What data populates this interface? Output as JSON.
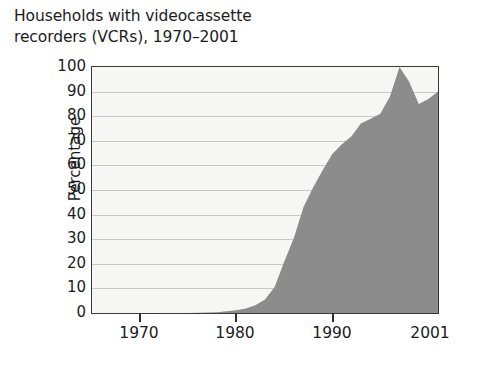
{
  "chart_data": {
    "type": "area",
    "title": "Households with videocassette recorders (VCRs), 1970–2001",
    "title_line1": "Households with videocassette",
    "title_line2": "recorders (VCRs), 1970–2001",
    "xlabel": "",
    "ylabel": "Percentage",
    "xlim": [
      1965,
      2001
    ],
    "ylim": [
      0,
      100
    ],
    "grid": true,
    "legend": false,
    "fill_color": "#8c8c8c",
    "plot_background": "#f6f6f4",
    "gridline_color": "#c9c9c6",
    "axis_color": "#3a3a3a",
    "ytick_labels": [
      "100",
      "90",
      "80",
      "70",
      "60",
      "50",
      "40",
      "30",
      "20",
      "10",
      "0"
    ],
    "ytick_values": [
      100,
      90,
      80,
      70,
      60,
      50,
      40,
      30,
      20,
      10,
      0
    ],
    "xtick_labels": [
      "1970",
      "1980",
      "1990",
      "2001"
    ],
    "xtick_values": [
      1970,
      1980,
      1990,
      2001
    ],
    "x": [
      1965,
      1970,
      1975,
      1978,
      1980,
      1981,
      1982,
      1983,
      1984,
      1985,
      1986,
      1987,
      1988,
      1989,
      1990,
      1991,
      1992,
      1993,
      1994,
      1995,
      1996,
      1997,
      1998,
      1999,
      2000,
      2001
    ],
    "values": [
      0,
      0,
      0,
      0.3,
      1.1,
      1.8,
      3.1,
      5.5,
      10.6,
      20.8,
      30.5,
      43.0,
      51.0,
      58.0,
      64.6,
      68.6,
      71.9,
      77.1,
      79.0,
      81.0,
      88.0,
      100.0,
      94.0,
      85.0,
      87.0,
      90.0
    ]
  }
}
